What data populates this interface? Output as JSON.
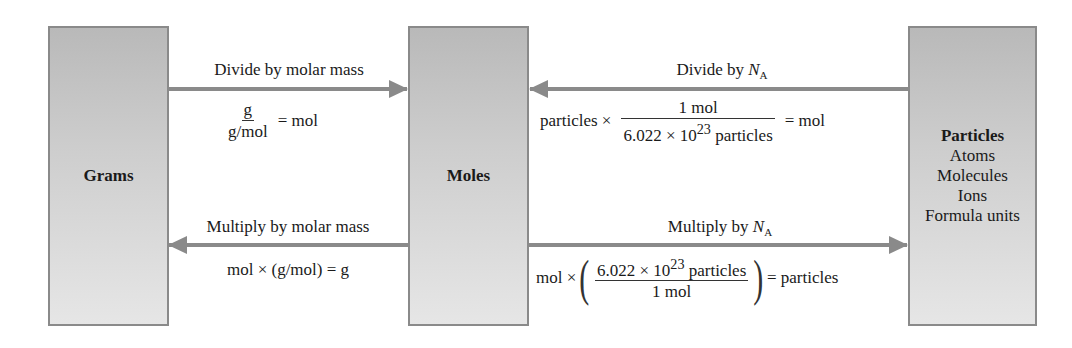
{
  "boxes": {
    "grams": {
      "title": "Grams"
    },
    "moles": {
      "title": "Moles"
    },
    "particles": {
      "title": "Particles",
      "items": [
        "Atoms",
        "Molecules",
        "Ions",
        "Formula units"
      ]
    }
  },
  "arrows": {
    "grams_to_moles": {
      "label": "Divide by molar mass",
      "eq": {
        "num": "g",
        "den": "g/mol",
        "result": "= mol"
      }
    },
    "particles_to_moles": {
      "label_prefix": "Divide by ",
      "label_var": "N",
      "label_sub": "A",
      "eq": {
        "lhs": "particles ×",
        "num": "1 mol",
        "den_prefix": "6.022 × 10",
        "den_exp": "23",
        "den_suffix": " particles",
        "result": "= mol"
      }
    },
    "moles_to_grams": {
      "label": "Multiply by molar mass",
      "eq": "mol × (g/mol) = g"
    },
    "moles_to_particles": {
      "label_prefix": "Multiply by ",
      "label_var": "N",
      "label_sub": "A",
      "eq": {
        "lhs": "mol ×",
        "num_prefix": "6.022 × 10",
        "num_exp": "23",
        "num_suffix": " particles",
        "den": "1 mol",
        "result": "= particles"
      }
    }
  },
  "colors": {
    "box_fill_top": "#b9b9b9",
    "box_fill_bottom": "#e6e6e6",
    "box_border": "#8a8a8a",
    "arrow": "#8a8a8a",
    "text": "#1a1a1a"
  }
}
